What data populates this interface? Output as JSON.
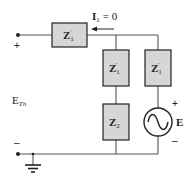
{
  "diagram": {
    "type": "circuit-schematic",
    "colors": {
      "wire": "#555555",
      "box_fill": "#d6d6d6",
      "box_stroke": "#222222",
      "text": "#222222",
      "muted_text": "#999999"
    },
    "terminal": {
      "plus": "+",
      "minus": "–",
      "label_main": "E",
      "label_sub": "Th"
    },
    "current": {
      "label_main": "I",
      "label_sub": "1",
      "equals": "= 0"
    },
    "components": [
      {
        "id": "z1-series",
        "label_main": "Z",
        "label_sub": "1",
        "prime": "′"
      },
      {
        "id": "z1-mid",
        "label_main": "Z",
        "label_sub": "1",
        "prime": "′"
      },
      {
        "id": "z1-right",
        "label_main": "Z",
        "label_sub": "1",
        "prime": "′"
      },
      {
        "id": "z2",
        "label_main": "Z",
        "label_sub": "2"
      }
    ],
    "source": {
      "label": "E",
      "plus": "+",
      "minus": "–",
      "symbol": "sine-wave"
    }
  }
}
